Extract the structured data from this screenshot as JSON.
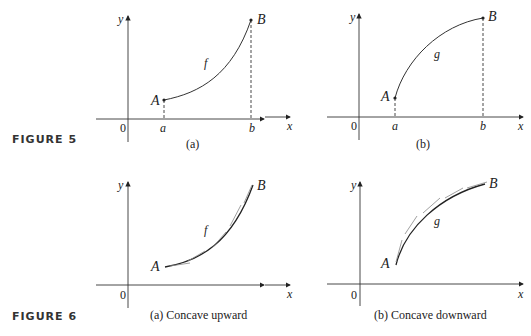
{
  "figures": [
    {
      "label": "FIGURE 5",
      "panels": [
        {
          "caption": "(a)",
          "function_label": "f",
          "start_point": "A",
          "end_point": "B",
          "x_ticks": [
            "a",
            "b"
          ],
          "origin": "0",
          "x_axis": "x",
          "y_axis": "y",
          "shape": "increasing concave up with dashed verticals at a and b"
        },
        {
          "caption": "(b)",
          "function_label": "g",
          "start_point": "A",
          "end_point": "B",
          "x_ticks": [
            "a",
            "b"
          ],
          "origin": "0",
          "x_axis": "x",
          "y_axis": "y",
          "shape": "increasing concave down with dashed verticals at a and b"
        }
      ]
    },
    {
      "label": "FIGURE 6",
      "panels": [
        {
          "caption": "(a) Concave upward",
          "function_label": "f",
          "start_point": "A",
          "end_point": "B",
          "origin": "0",
          "x_axis": "x",
          "y_axis": "y",
          "shape": "concave upward curve with tangent lines below the curve"
        },
        {
          "caption": "(b) Concave downward",
          "function_label": "g",
          "start_point": "A",
          "end_point": "B",
          "origin": "0",
          "x_axis": "x",
          "y_axis": "y",
          "shape": "concave downward curve with tangent lines above the curve"
        }
      ]
    }
  ]
}
